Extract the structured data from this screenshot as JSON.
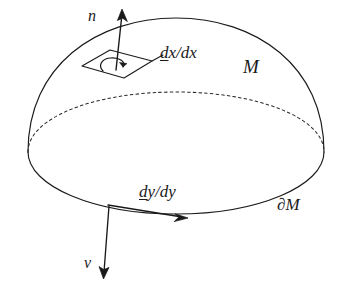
{
  "figure": {
    "kind": "manifold-with-boundary-diagram",
    "background_color": "#ffffff",
    "ink_color": "#1a1a1a",
    "width": 348,
    "height": 287,
    "labels": {
      "normal_vector": "n",
      "manifold": "M",
      "boundary": "∂M",
      "conormal_vector": "ν",
      "surface_form_prefix": "d",
      "surface_form_suffix": "x/dx",
      "boundary_form_prefix": "d",
      "boundary_form_suffix": "y/dy"
    },
    "elements": {
      "dome_outline": "solid-hemisphere-arc",
      "equator_back": "dashed-ellipse-arc",
      "boundary_ellipse": "solid-ellipse-arc",
      "tangent_patch": "parallelogram",
      "orientation_marker": "curl-arrow",
      "normal_arrow": "upward-arrow",
      "conormal_arrow": "downward-arrow",
      "boundary_tangent_arrow": "rightward-arrow"
    }
  }
}
